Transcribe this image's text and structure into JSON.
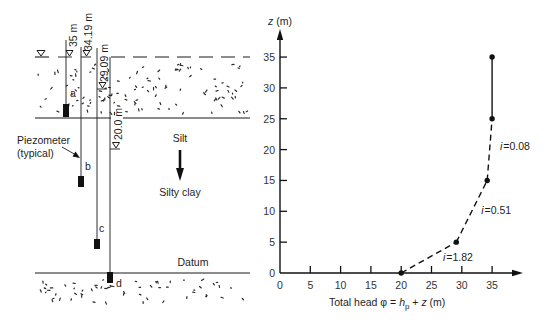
{
  "profile": {
    "piezometers": [
      {
        "id": "a",
        "head_label": "35 m"
      },
      {
        "id": "b",
        "head_label": "34.19 m"
      },
      {
        "id": "c",
        "head_label": "29.09 m"
      },
      {
        "id": "d",
        "head_label": "20.0 m"
      }
    ],
    "layer_labels": {
      "upper": "Silt",
      "lower": "Silty clay",
      "datum": "Datum"
    },
    "callout": {
      "line1": "Piezometer",
      "line2": "(typical)"
    },
    "icons": {
      "water_table": "inverted-triangle-water-level-icon",
      "flow_direction": "down-arrow-icon"
    }
  },
  "chart_data": {
    "type": "line",
    "title": "",
    "xlabel": "Total head φ = h_p + z (m)",
    "xlabel_parts": {
      "prefix": "Total head φ = ",
      "h": "h",
      "h_sub": "p",
      "plus": " + ",
      "z": "z",
      "suffix": " (m)"
    },
    "ylabel": "z (m)",
    "ylabel_parts": {
      "var": "z",
      "unit": " (m)"
    },
    "xlim": [
      0,
      39
    ],
    "ylim": [
      0,
      39
    ],
    "xticks": [
      0,
      5,
      10,
      15,
      20,
      25,
      30,
      35
    ],
    "yticks": [
      0,
      5,
      10,
      15,
      20,
      25,
      30,
      35
    ],
    "grid": false,
    "legend": "none",
    "series": [
      {
        "name": "Total head profile",
        "points": [
          {
            "x": 20,
            "y": 0
          },
          {
            "x": 29.09,
            "y": 5
          },
          {
            "x": 34.19,
            "y": 15
          },
          {
            "x": 35,
            "y": 25
          },
          {
            "x": 35,
            "y": 35
          }
        ],
        "segments": [
          {
            "from": 0,
            "to": 1,
            "style": "dashed"
          },
          {
            "from": 1,
            "to": 2,
            "style": "dashed"
          },
          {
            "from": 2,
            "to": 3,
            "style": "dashed"
          },
          {
            "from": 3,
            "to": 4,
            "style": "solid"
          }
        ]
      }
    ],
    "annotations": [
      {
        "label": "i=0.08",
        "var": "i",
        "text": "=0.08",
        "x": 36.3,
        "y": 20.0
      },
      {
        "label": "i=0.51",
        "var": "i",
        "text": "=0.51",
        "x": 33.2,
        "y": 9.6
      },
      {
        "label": "i=1.82",
        "var": "i",
        "text": "=1.82",
        "x": 26.9,
        "y": 2.0
      }
    ]
  }
}
